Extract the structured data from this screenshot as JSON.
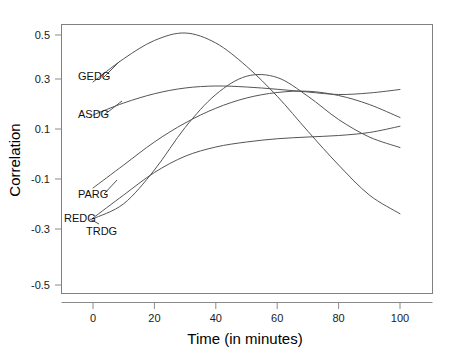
{
  "chart_data": {
    "type": "line",
    "title": "",
    "xlabel": "Time (in minutes)",
    "ylabel": "Correlation",
    "xlim": [
      -10,
      112
    ],
    "ylim": [
      -0.58,
      0.58
    ],
    "grid": false,
    "legend": "inline-labels-left",
    "xticks": [
      0,
      20,
      40,
      60,
      80,
      100
    ],
    "xtick_labels": [
      "0",
      "20",
      "40",
      "60",
      "80",
      "100"
    ],
    "yticks": [
      0.5,
      0.3,
      0.1,
      -0.1,
      -0.3,
      -0.5
    ],
    "ytick_labels": [
      "0.5",
      "0.3",
      "0.1",
      "-0.1",
      "-0.3",
      "-0.5"
    ],
    "x": [
      0,
      10,
      20,
      30,
      40,
      50,
      60,
      70,
      80,
      90,
      100
    ],
    "series": [
      {
        "name": "GEDG",
        "label": "GEDG",
        "color": "#555555",
        "values": [
          0.312,
          0.405,
          0.478,
          0.508,
          0.468,
          0.375,
          0.255,
          0.115,
          -0.02,
          -0.14,
          -0.215
        ]
      },
      {
        "name": "ASDG",
        "label": "ASDG",
        "color": "#555555",
        "values": [
          0.18,
          0.228,
          0.265,
          0.288,
          0.296,
          0.292,
          0.283,
          0.272,
          0.262,
          0.268,
          0.282
        ]
      },
      {
        "name": "PARG",
        "label": "PARG",
        "color": "#555555",
        "values": [
          -0.112,
          -0.02,
          0.072,
          0.148,
          0.207,
          0.248,
          0.27,
          0.275,
          0.258,
          0.222,
          0.17
        ]
      },
      {
        "name": "REDG",
        "label": "REDG",
        "color": "#555555",
        "values": [
          -0.232,
          -0.14,
          -0.05,
          0.015,
          0.052,
          0.072,
          0.085,
          0.092,
          0.098,
          0.11,
          0.135
        ]
      },
      {
        "name": "TRDG",
        "label": "TRDG",
        "color": "#555555",
        "values": [
          -0.235,
          -0.175,
          -0.04,
          0.13,
          0.262,
          0.335,
          0.33,
          0.255,
          0.162,
          0.092,
          0.05
        ]
      }
    ],
    "annotations": [
      {
        "text": "GEDG",
        "x_px": 78,
        "y_px": 80
      },
      {
        "text": "ASDG",
        "x_px": 78,
        "y_px": 118
      },
      {
        "text": "PARG",
        "x_px": 78,
        "y_px": 198
      },
      {
        "text": "REDG",
        "x_px": 64,
        "y_px": 222
      },
      {
        "text": "TRDG",
        "x_px": 86,
        "y_px": 235
      }
    ]
  }
}
